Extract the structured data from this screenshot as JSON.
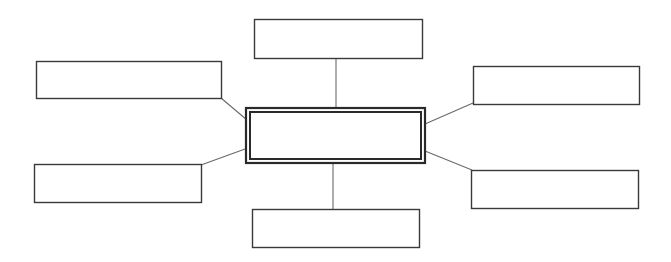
{
  "diagram": {
    "type": "mind-map / spider diagram",
    "stroke_color": "#3a3a3a",
    "connector_color": "#6a6a6a",
    "background": "#ffffff",
    "center": {
      "label": "",
      "x": 245,
      "y": 107,
      "w": 181,
      "h": 57,
      "style": "double-border"
    },
    "nodes": [
      {
        "id": "top",
        "label": "",
        "x": 254,
        "y": 19,
        "w": 168,
        "h": 39
      },
      {
        "id": "top-left",
        "label": "",
        "x": 36,
        "y": 61,
        "w": 185,
        "h": 37
      },
      {
        "id": "top-right",
        "label": "",
        "x": 473,
        "y": 66,
        "w": 166,
        "h": 38
      },
      {
        "id": "bottom-left",
        "label": "",
        "x": 34,
        "y": 164,
        "w": 167,
        "h": 38
      },
      {
        "id": "bottom-right",
        "label": "",
        "x": 471,
        "y": 170,
        "w": 167,
        "h": 38
      },
      {
        "id": "bottom",
        "label": "",
        "x": 252,
        "y": 209,
        "w": 167,
        "h": 38
      }
    ],
    "connectors": [
      {
        "from": "center",
        "to": "top",
        "x1": 336,
        "y1": 107,
        "x2": 336,
        "y2": 58
      },
      {
        "from": "center",
        "to": "top-left",
        "x1": 247,
        "y1": 120,
        "x2": 221,
        "y2": 98
      },
      {
        "from": "center",
        "to": "top-right",
        "x1": 425,
        "y1": 124,
        "x2": 473,
        "y2": 103
      },
      {
        "from": "center",
        "to": "bottom-left",
        "x1": 245,
        "y1": 149,
        "x2": 201,
        "y2": 165
      },
      {
        "from": "center",
        "to": "bottom-right",
        "x1": 425,
        "y1": 151,
        "x2": 472,
        "y2": 170
      },
      {
        "from": "center",
        "to": "bottom",
        "x1": 333,
        "y1": 164,
        "x2": 333,
        "y2": 209
      }
    ]
  }
}
